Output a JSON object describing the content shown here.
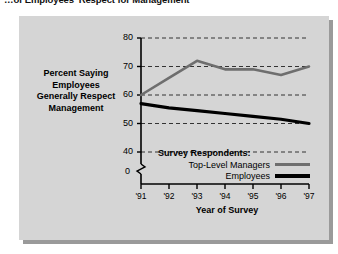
{
  "title": "…of Employees' Respect for Management",
  "panel": {
    "bg_color": "#d5d5d5",
    "shadow_color": "#9a9a9a"
  },
  "axis_caption": {
    "line1": "Percent Saying",
    "line2": "Employees",
    "line3": "Generally Respect",
    "line4": "Management"
  },
  "legend": {
    "title": "Survey Respondents:",
    "items": [
      {
        "label": "Top-Level Managers",
        "color": "#6e6e6e"
      },
      {
        "label": "Employees",
        "color": "#000000"
      }
    ]
  },
  "origin_label": "0",
  "chart_data": {
    "type": "line",
    "title": "…of Employees' Respect for Management",
    "xlabel": "Year of Survey",
    "ylabel": "Percent Saying Employees Generally Respect Management",
    "x": [
      "'91",
      "'92",
      "'93",
      "'94",
      "'95",
      "'96",
      "'97"
    ],
    "categories": [
      "'91",
      "'92",
      "'93",
      "'94",
      "'95",
      "'96",
      "'97"
    ],
    "yticks": [
      40,
      50,
      60,
      70,
      80
    ],
    "xticks": [
      "'91",
      "'92",
      "'93",
      "'94",
      "'95",
      "'96",
      "'97"
    ],
    "ylim": [
      40,
      80
    ],
    "grid": "horizontal-dashed",
    "axis_break": true,
    "legend_position": "inside-bottom-right",
    "series": [
      {
        "name": "Top-Level Managers",
        "color": "#6e6e6e",
        "values": [
          60,
          66,
          72,
          69,
          69,
          67,
          70
        ]
      },
      {
        "name": "Employees",
        "color": "#000000",
        "values": [
          57,
          55.5,
          54.5,
          53.5,
          52.5,
          51.5,
          50
        ]
      }
    ]
  }
}
